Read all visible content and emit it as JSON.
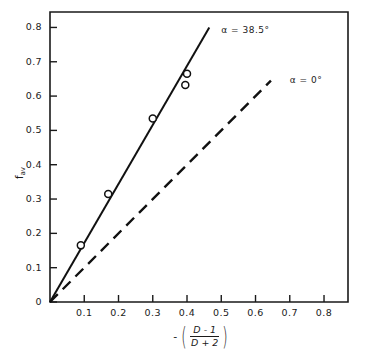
{
  "chart_data": {
    "type": "line",
    "title": "",
    "xlabel": "-((D-1)/(D+2))",
    "ylabel": "f_av",
    "xlim": [
      0,
      0.87
    ],
    "ylim": [
      0,
      0.845
    ],
    "grid": false,
    "legend_position": "inline-annotations",
    "xticks": [
      "0.1",
      "0.2",
      "0.3",
      "0.4",
      "0.5",
      "0.6",
      "0.7",
      "0.8"
    ],
    "xtick_values": [
      0.1,
      0.2,
      0.3,
      0.4,
      0.5,
      0.6,
      0.7,
      0.8
    ],
    "yticks": [
      "0",
      "0.1",
      "0.2",
      "0.3",
      "0.4",
      "0.5",
      "0.6",
      "0.7",
      "0.8"
    ],
    "ytick_values": [
      0,
      0.1,
      0.2,
      0.3,
      0.4,
      0.5,
      0.6,
      0.7,
      0.8
    ],
    "series": [
      {
        "name": "alpha = 38.5 deg",
        "style": "solid",
        "slope": 1.72,
        "x": [
          0.0,
          0.465
        ],
        "values": [
          0.0,
          0.8
        ],
        "markers": "open-circle",
        "points_x": [
          0.09,
          0.17,
          0.3,
          0.4,
          0.395
        ],
        "points_y": [
          0.165,
          0.315,
          0.535,
          0.665,
          0.632
        ]
      },
      {
        "name": "alpha = 0 deg",
        "style": "dashed",
        "slope": 1.0,
        "x": [
          0.0,
          0.645
        ],
        "values": [
          0.0,
          0.645
        ],
        "markers": "none",
        "points_x": [],
        "points_y": []
      }
    ],
    "annotations": [
      {
        "text": "α =  38.5°",
        "x": 0.5,
        "y": 0.79
      },
      {
        "text": "α =  0°",
        "x": 0.7,
        "y": 0.645
      }
    ],
    "xlabel_parts": {
      "minus": "-",
      "numerator": "D - 1",
      "denominator": "D + 2"
    },
    "ylabel_parts": {
      "base": "f",
      "sub": "av"
    },
    "colors": {
      "axis": "#1a1a1a",
      "line": "#111111",
      "marker_stroke": "#111111",
      "background": "#ffffff"
    }
  }
}
